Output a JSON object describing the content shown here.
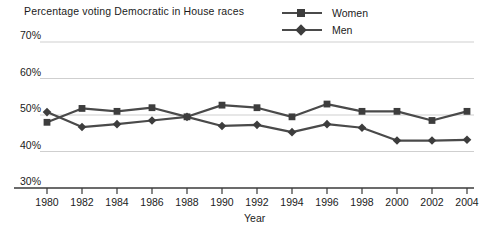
{
  "chart_data": {
    "type": "line",
    "title": "Percentage voting Democratic in House races",
    "xlabel": "Year",
    "ylabel": "",
    "x": [
      1980,
      1982,
      1984,
      1986,
      1988,
      1990,
      1992,
      1994,
      1996,
      1998,
      2000,
      2002,
      2004
    ],
    "categories": [
      "1980",
      "1982",
      "1984",
      "1986",
      "1988",
      "1990",
      "1992",
      "1994",
      "1996",
      "1998",
      "2000",
      "2002",
      "2004"
    ],
    "series": [
      {
        "name": "Women",
        "marker": "square",
        "color": "#3d3d3d",
        "values": [
          48.0,
          51.8,
          51.0,
          52.0,
          49.5,
          52.7,
          52.0,
          49.5,
          53.0,
          51.0,
          51.0,
          48.5,
          51.0
        ]
      },
      {
        "name": "Men",
        "marker": "diamond",
        "color": "#3d3d3d",
        "values": [
          50.8,
          46.7,
          47.5,
          48.5,
          49.5,
          47.0,
          47.3,
          45.3,
          47.5,
          46.5,
          43.0,
          43.0,
          43.2
        ]
      }
    ],
    "ylim": [
      30,
      70
    ],
    "yticks": [
      30,
      40,
      50,
      60,
      70
    ],
    "ytick_labels": [
      "30%",
      "40%",
      "50%",
      "60%",
      "70%"
    ],
    "grid": true,
    "legend_position": "top-right",
    "line_color": "#4a4a4a",
    "grid_color": "#cfcfcf",
    "axis_color": "#3a3a3a"
  },
  "legend": {
    "items": [
      {
        "label": "Women",
        "marker": "square"
      },
      {
        "label": "Men",
        "marker": "diamond"
      }
    ]
  }
}
